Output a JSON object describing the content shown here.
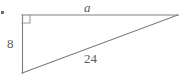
{
  "figure": {
    "kind": "right-triangle-diagram",
    "background_color": "#ffffff",
    "stroke_color": "#808080",
    "text_color": "#5a5a5a",
    "stroke_width": 1,
    "canvas": {
      "width": 186,
      "height": 84
    },
    "vertices": {
      "top_left": {
        "x": 22,
        "y": 15
      },
      "top_right": {
        "x": 178,
        "y": 15
      },
      "bottom_left": {
        "x": 22,
        "y": 73
      }
    },
    "right_angle_marker": {
      "at": "top_left",
      "size": 8,
      "description": "small square marking the 90 degree angle"
    },
    "edges": [
      {
        "name": "top-leg",
        "from": "top_left",
        "to": "top_right",
        "label": "a",
        "label_style": "italic"
      },
      {
        "name": "vertical-leg",
        "from": "top_left",
        "to": "bottom_left",
        "label": "8",
        "label_style": "normal"
      },
      {
        "name": "hypotenuse",
        "from": "bottom_left",
        "to": "top_right",
        "label": "24",
        "label_style": "normal"
      }
    ],
    "labels": {
      "top_side": "a",
      "left_side": "8",
      "hypotenuse": "24"
    },
    "marks": {
      "corner_dot": "•"
    }
  }
}
